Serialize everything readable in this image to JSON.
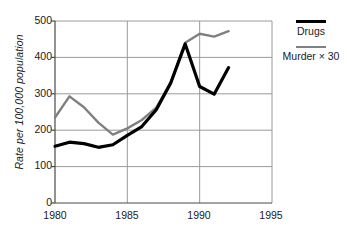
{
  "chart_data": {
    "type": "line",
    "title": "",
    "xlabel": "",
    "ylabel": "Rate per 100,000 population",
    "xlim": [
      1980,
      1995
    ],
    "ylim": [
      0,
      500
    ],
    "xticks": [
      1980,
      1985,
      1990,
      1995
    ],
    "yticks": [
      0,
      100,
      200,
      300,
      400,
      500
    ],
    "grid": true,
    "legend_position": "right",
    "x": [
      1980,
      1981,
      1982,
      1983,
      1984,
      1985,
      1986,
      1987,
      1988,
      1989,
      1990,
      1991,
      1992
    ],
    "series": [
      {
        "name": "Drugs",
        "color": "#000000",
        "width": 3.2,
        "values": [
          156,
          167,
          163,
          153,
          160,
          186,
          210,
          256,
          330,
          437,
          320,
          299,
          372
        ]
      },
      {
        "name": "Murder × 30",
        "color": "#808080",
        "width": 2.4,
        "values": [
          235,
          293,
          263,
          221,
          188,
          205,
          228,
          262,
          330,
          440,
          465,
          457,
          472
        ]
      }
    ]
  },
  "axes": {
    "y_tick_labels": [
      "500",
      "400",
      "300",
      "200",
      "100",
      "0"
    ],
    "x_tick_labels": [
      "1980",
      "1985",
      "1990",
      "1995"
    ],
    "y_axis_title": "Rate per 100,000 population"
  },
  "legend": {
    "items": [
      {
        "label": "Drugs",
        "color": "#000000"
      },
      {
        "label": "Murder × 30",
        "color": "#808080"
      }
    ]
  },
  "colors": {
    "drugs": "#000000",
    "murder": "#808080",
    "grid": "#9a9a9a",
    "axis": "#4a4a4a",
    "background": "#ffffff"
  }
}
